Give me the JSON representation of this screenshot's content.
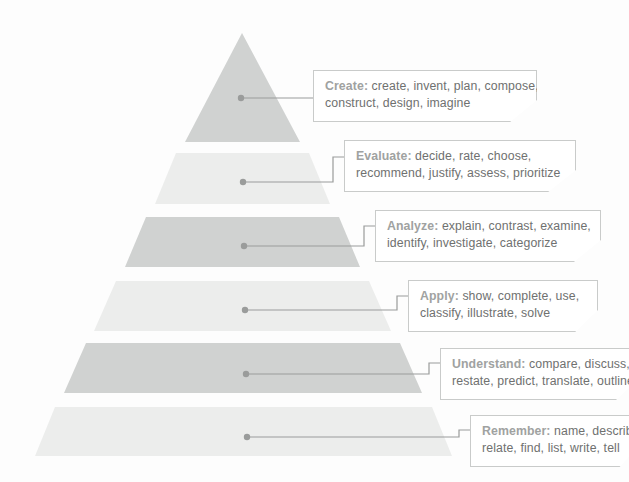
{
  "diagram": {
    "background_color": "#fdfdfd",
    "tier_dark_color": "#d0d2d1",
    "tier_light_color": "#ecedec",
    "callout_border_color": "#c9cbca",
    "callout_bg_color": "#ffffff",
    "lead_text_color": "#a0a2a1",
    "body_text_color": "#6f7170",
    "connector_color": "#9a9c9b"
  },
  "levels": [
    {
      "id": "create",
      "name": "Create",
      "lead": "Create:",
      "line1": " create, invent, plan, compose,",
      "line2": "construct, design, imagine",
      "verbs": [
        "create",
        "invent",
        "plan",
        "compose",
        "construct",
        "design",
        "imagine"
      ],
      "shade": "dark",
      "rank": 6
    },
    {
      "id": "evaluate",
      "name": "Evaluate",
      "lead": "Evaluate:",
      "line1": " decide, rate, choose,",
      "line2": "recommend, justify, assess, prioritize",
      "verbs": [
        "decide",
        "rate",
        "choose",
        "recommend",
        "justify",
        "assess",
        "prioritize"
      ],
      "shade": "light",
      "rank": 5
    },
    {
      "id": "analyze",
      "name": "Analyze",
      "lead": "Analyze:",
      "line1": " explain, contrast, examine,",
      "line2": "identify, investigate, categorize",
      "verbs": [
        "explain",
        "contrast",
        "examine",
        "identify",
        "investigate",
        "categorize"
      ],
      "shade": "dark",
      "rank": 4
    },
    {
      "id": "apply",
      "name": "Apply",
      "lead": "Apply:",
      "line1": " show, complete, use,",
      "line2": "classify, illustrate, solve",
      "verbs": [
        "show",
        "complete",
        "use",
        "classify",
        "illustrate",
        "solve"
      ],
      "shade": "light",
      "rank": 3
    },
    {
      "id": "understand",
      "name": "Understand",
      "lead": "Understand:",
      "line1": " compare, discuss,",
      "line2": "restate, predict, translate, outline",
      "verbs": [
        "compare",
        "discuss",
        "restate",
        "predict",
        "translate",
        "outline"
      ],
      "shade": "dark",
      "rank": 2
    },
    {
      "id": "remember",
      "name": "Remember",
      "lead": "Remember:",
      "line1": " name, describ",
      "line2": "relate, find, list, write, tell",
      "verbs": [
        "name",
        "describe",
        "relate",
        "find",
        "list",
        "write",
        "tell"
      ],
      "shade": "light",
      "rank": 1
    }
  ]
}
